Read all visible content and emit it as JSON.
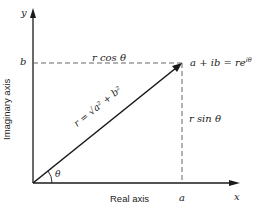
{
  "diagram": {
    "type": "complex-plane-polar-form",
    "colors": {
      "line": "#1a1a1a",
      "dashed": "#555555",
      "text": "#222222",
      "background": "#ffffff"
    },
    "axes": {
      "x_axis_label": "Real axis",
      "y_axis_label": "Imaginary axis",
      "x_symbol": "x",
      "y_symbol": "y"
    },
    "point": {
      "label": "a + ib = re",
      "exponent": "iθ"
    },
    "ticks": {
      "a": "a",
      "b": "b"
    },
    "segments": {
      "horizontal_label": "r cos θ",
      "vertical_label": "r sin θ",
      "radius_label": "r = √a² + b²"
    },
    "angle": {
      "label": "θ"
    }
  }
}
